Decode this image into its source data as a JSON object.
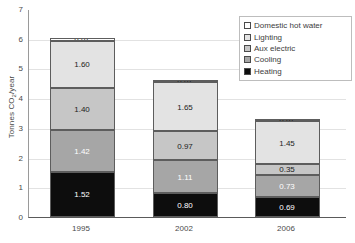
{
  "chart_data": {
    "type": "bar",
    "stacked": true,
    "title": "",
    "xlabel": "",
    "ylabel": "Tonnes CO2/year",
    "ylabel_prefix": "Tonnes CO",
    "ylabel_sub": "2",
    "ylabel_suffix": "/year",
    "categories": [
      "1995",
      "2002",
      "2006"
    ],
    "ylim": [
      0,
      7
    ],
    "yticks": [
      "7",
      "6",
      "5",
      "4",
      "3",
      "2",
      "1",
      "0"
    ],
    "ytick_values": [
      7,
      6,
      5,
      4,
      3,
      2,
      1,
      0
    ],
    "grid": true,
    "grid_axis": "y",
    "legend_position": "top-right",
    "series": [
      {
        "name": "Domestic hot water",
        "color": "#ffffff",
        "label_color": "dark",
        "values": [
          0.07,
          0.07,
          0.07
        ],
        "labels": [
          "0.07",
          "0.07",
          "0.07"
        ]
      },
      {
        "name": "Lighting",
        "color": "#e3e3e3",
        "label_color": "dark",
        "values": [
          1.6,
          1.65,
          1.45
        ],
        "labels": [
          "1.60",
          "1.65",
          "1.45"
        ]
      },
      {
        "name": "Aux electric",
        "color": "#c6c6c6",
        "label_color": "dark",
        "values": [
          1.4,
          0.97,
          0.35
        ],
        "labels": [
          "1.40",
          "0.97",
          "0.35"
        ]
      },
      {
        "name": "Cooling",
        "color": "#a6a6a6",
        "label_color": "light",
        "values": [
          1.42,
          1.11,
          0.73
        ],
        "labels": [
          "1.42",
          "1.11",
          "0.73"
        ]
      },
      {
        "name": "Heating",
        "color": "#0d0d0d",
        "label_color": "light",
        "values": [
          1.52,
          0.8,
          0.69
        ],
        "labels": [
          "1.52",
          "0.80",
          "0.69"
        ]
      }
    ],
    "totals": [
      6.01,
      4.6,
      3.29
    ]
  }
}
